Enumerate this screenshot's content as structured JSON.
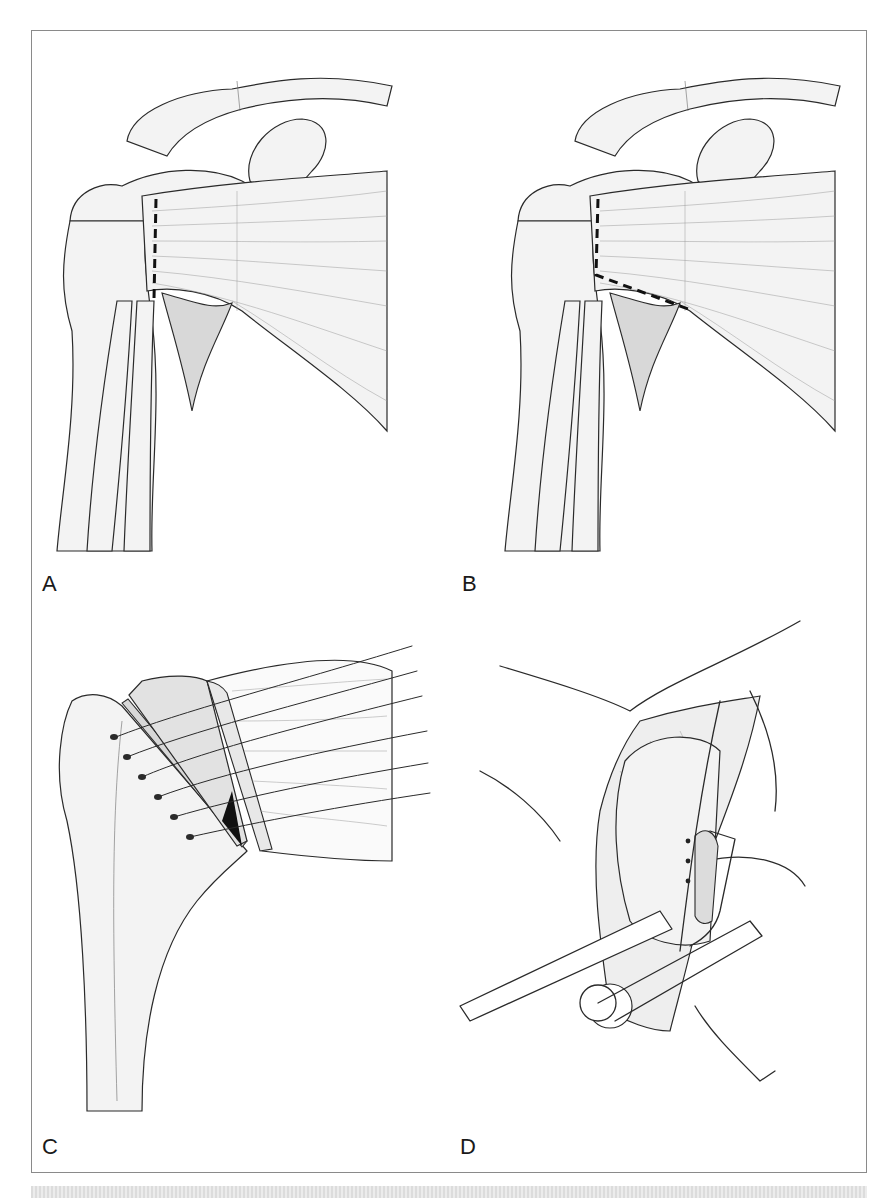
{
  "figure": {
    "panels": [
      {
        "id": "A",
        "label": "A",
        "description": "Shoulder anatomy with vertical dashed incision line on rotator cuff tendon"
      },
      {
        "id": "B",
        "label": "B",
        "description": "Shoulder anatomy with L-shaped dashed incision line on rotator cuff tendon"
      },
      {
        "id": "C",
        "label": "C",
        "description": "Proximal humerus with tendon flap and sutures passed through bone tunnels"
      },
      {
        "id": "D",
        "label": "D",
        "description": "Surgical exposure with retractors and instrument in operative field"
      }
    ]
  },
  "colors": {
    "ink": "#2a2a2a",
    "frame_border": "#8a8a8a",
    "background": "#ffffff",
    "footer_strip": "#e6e6e6"
  }
}
